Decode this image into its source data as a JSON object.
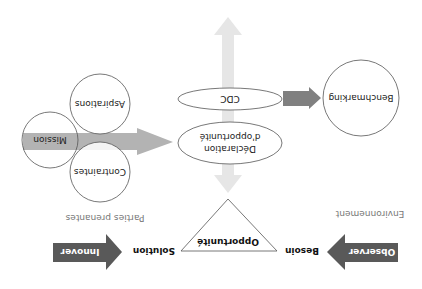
{
  "diagram": {
    "orientation": "rotated 180 degrees",
    "colors": {
      "dark_arrow": "#595959",
      "medium_arrow": "#808080",
      "light_arrow": "#b3b3b3",
      "pale_arrow": "#e6e6e6",
      "outline": "#555555",
      "muted_text": "#777777"
    },
    "bottom_row": {
      "observer_arrow_label": "Observer",
      "besoin_label": "Besoin",
      "solution_label": "Solution",
      "innover_arrow_label": "Innover"
    },
    "section_labels": {
      "environment": "Environnement",
      "stakeholders": "Parties prenantes"
    },
    "triangle_label": "Opportunité",
    "center": {
      "declaration_line1": "Déclaration",
      "declaration_line2": "d'opportunité",
      "cdc": "CDC"
    },
    "benchmarking": "Benchmarking",
    "stakeholder_circles": {
      "mission": "Mission",
      "aspirations": "Aspirations",
      "contraintes": "Contraintes"
    }
  }
}
